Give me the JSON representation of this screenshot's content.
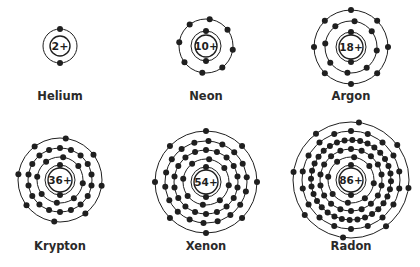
{
  "diagram": {
    "title": "",
    "colors": {
      "ink": "#1f1f1f",
      "label": "#2a2a2a",
      "background": "#ffffff"
    },
    "atoms": [
      {
        "name": "Helium",
        "charge": "2+",
        "cx": 60,
        "cy": 46,
        "nucleus_r": 10,
        "shells": [
          17
        ],
        "electrons": [
          2
        ],
        "label_y": 89
      },
      {
        "name": "Neon",
        "charge": "10+",
        "cx": 206,
        "cy": 46,
        "nucleus_r": 11,
        "shells": [
          15,
          27
        ],
        "electrons": [
          2,
          8
        ],
        "label_y": 89
      },
      {
        "name": "Argon",
        "charge": "18+",
        "cx": 351,
        "cy": 47,
        "nucleus_r": 12,
        "shells": [
          15,
          26,
          37
        ],
        "electrons": [
          2,
          8,
          8
        ],
        "label_y": 89
      },
      {
        "name": "Krypton",
        "charge": "36+",
        "cx": 60,
        "cy": 180,
        "nucleus_r": 12,
        "shells": [
          15,
          23,
          32,
          42
        ],
        "electrons": [
          2,
          8,
          18,
          8
        ],
        "label_y": 239
      },
      {
        "name": "Xenon",
        "charge": "54+",
        "cx": 206,
        "cy": 182,
        "nucleus_r": 12,
        "shells": [
          15,
          23,
          32,
          41,
          51
        ],
        "electrons": [
          2,
          8,
          18,
          18,
          8
        ],
        "label_y": 239
      },
      {
        "name": "Radon",
        "charge": "86+",
        "cx": 351,
        "cy": 180,
        "nucleus_r": 12,
        "shells": [
          15,
          23,
          31,
          40,
          49,
          58
        ],
        "electrons": [
          2,
          8,
          18,
          32,
          18,
          8
        ],
        "label_y": 239
      }
    ]
  }
}
